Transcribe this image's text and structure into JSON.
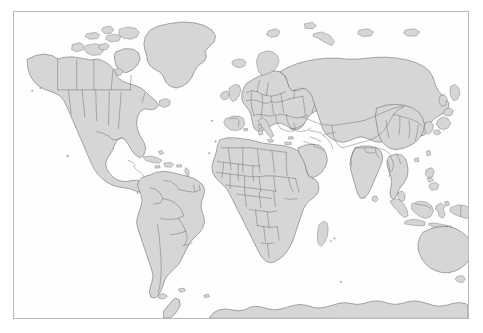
{
  "map": {
    "title": "World Map",
    "type": "political-world-map",
    "projection": "equirectangular",
    "background_color": "#ffffff",
    "ocean_color": "#fefefe",
    "land_fill_color": "#d6d6d6",
    "border_stroke_color": "#4a4a4a",
    "frame_stroke_color": "#b9b9b9",
    "frame": {
      "x": 13,
      "y": 11,
      "width": 456,
      "height": 308
    },
    "extent": {
      "lon_min": -180,
      "lon_max": 180,
      "lat_min": -62,
      "lat_max": 84
    },
    "labels_visible": false,
    "graticule_visible": false,
    "legend_visible": false,
    "scalebar_visible": false,
    "continents": [
      "North America",
      "South America",
      "Europe",
      "Africa",
      "Asia",
      "Oceania",
      "Antarctica"
    ],
    "notable_features": [
      "Greenland",
      "Iceland",
      "Canadian Arctic Archipelago",
      "Alaska",
      "Madagascar",
      "Japan",
      "Indonesian Archipelago",
      "Philippines",
      "New Zealand",
      "Papua New Guinea",
      "Tasmania",
      "British Isles",
      "Sri Lanka",
      "Kamchatka Peninsula",
      "Tierra del Fuego",
      "Antarctic coastline"
    ],
    "internal_borders_shown": true
  }
}
